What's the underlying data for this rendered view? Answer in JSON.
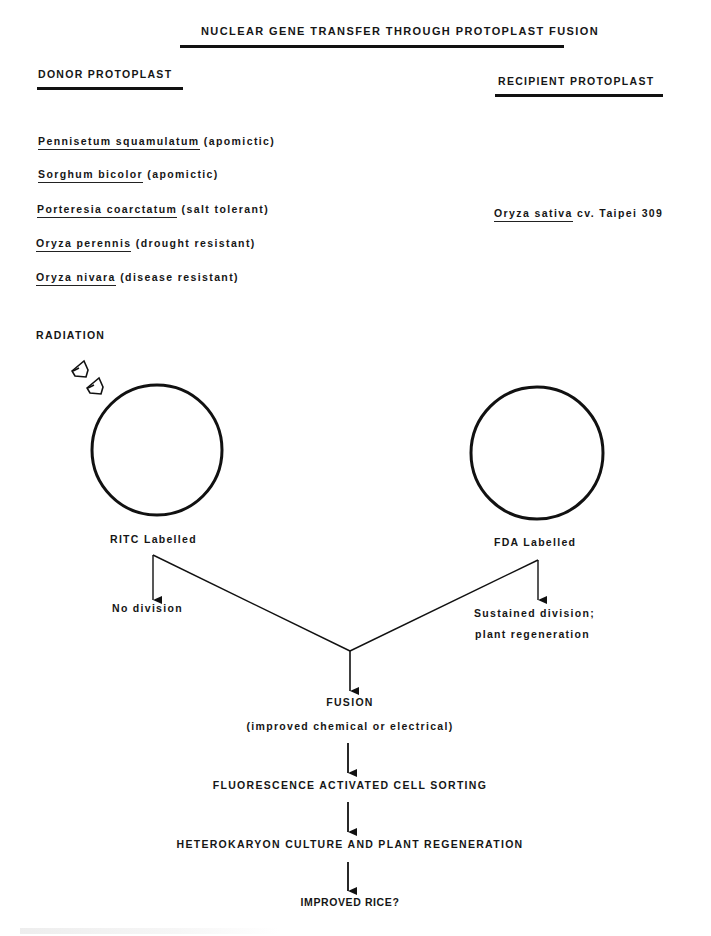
{
  "title": "NUCLEAR GENE TRANSFER THROUGH PROTOPLAST FUSION",
  "donor": {
    "heading": "DONOR PROTOPLAST",
    "species": [
      {
        "name": "Pennisetum squamulatum",
        "trait": "(apomictic)"
      },
      {
        "name": "Sorghum bicolor",
        "trait": "(apomictic)"
      },
      {
        "name": "Porteresia coarctatum",
        "trait": "(salt tolerant)"
      },
      {
        "name": "Oryza perennis",
        "trait": "(drought resistant)"
      },
      {
        "name": "Oryza nivara",
        "trait": "(disease resistant)"
      }
    ],
    "radiation_label": "RADIATION",
    "cell_label": "RITC Labelled",
    "outcome": "No division"
  },
  "recipient": {
    "heading": "RECIPIENT PROTOPLAST",
    "species": {
      "name": "Oryza sativa",
      "trait": "cv. Taipei 309"
    },
    "cell_label": "FDA Labelled",
    "outcome_line1": "Sustained division;",
    "outcome_line2": "plant regeneration"
  },
  "flow": {
    "fusion": "FUSION",
    "fusion_note": "(improved chemical or electrical)",
    "sorting": "FLUORESCENCE ACTIVATED CELL SORTING",
    "culture": "HETEROKARYON CULTURE AND PLANT REGENERATION",
    "result": "IMPROVED RICE?"
  },
  "colors": {
    "ink": "#161616",
    "background": "#ffffff"
  }
}
